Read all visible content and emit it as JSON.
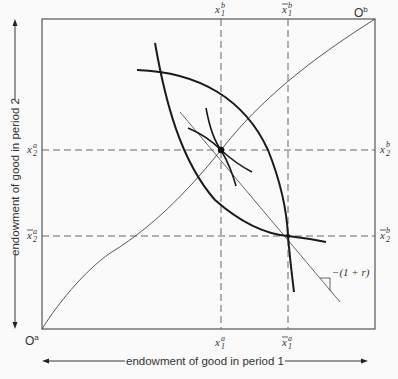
{
  "diagram": {
    "type": "edgeworth-box",
    "origins": {
      "a": "O",
      "a_sup": "a",
      "b": "O",
      "b_sup": "b"
    },
    "axes": {
      "x_label": "endowment of good in period 1",
      "y_label": "endowment of good in period 2"
    },
    "top_labels": [
      {
        "base": "x",
        "sub": "1",
        "sup": "b",
        "bar": false
      },
      {
        "base": "x",
        "sub": "1",
        "sup": "b",
        "bar": true
      }
    ],
    "bottom_labels": [
      {
        "base": "x",
        "sub": "1",
        "sup": "a",
        "bar": false
      },
      {
        "base": "x",
        "sub": "1",
        "sup": "a",
        "bar": true
      }
    ],
    "left_labels": [
      {
        "base": "x",
        "sub": "2",
        "sup": "a",
        "bar": false
      },
      {
        "base": "x",
        "sub": "2",
        "sup": "a",
        "bar": true
      }
    ],
    "right_labels": [
      {
        "base": "x",
        "sub": "2",
        "sup": "b",
        "bar": false
      },
      {
        "base": "x",
        "sub": "2",
        "sup": "b",
        "bar": true
      }
    ],
    "slope_label": "−(1 + r)",
    "colors": {
      "ink": "#222222",
      "box": "#555555",
      "dash": "#666666",
      "bg": "#fafafa"
    }
  }
}
